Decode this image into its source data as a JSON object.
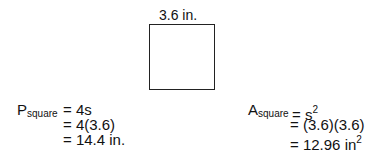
{
  "diagram": {
    "side_label": "3.6 in.",
    "shape": "square"
  },
  "perimeter": {
    "symbol": "P",
    "subscript": "square",
    "lines": [
      "= 4s",
      "= 4(3.6)",
      "= 14.4 in."
    ]
  },
  "area": {
    "symbol": "A",
    "subscript": "square",
    "line1_prefix": "= s",
    "line1_exp": "2",
    "line2": "= (3.6)(3.6)",
    "line3_prefix": "= 12.96 in",
    "line3_exp": "2"
  }
}
